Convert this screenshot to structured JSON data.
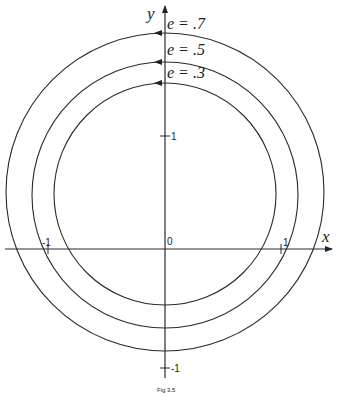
{
  "figure": {
    "x_axis_label": "x",
    "y_axis_label": "y",
    "origin_label": "0",
    "tick_labels": {
      "x_pos": "1",
      "x_neg": "-1",
      "y_pos": "1",
      "y_neg": "-1"
    },
    "curves": [
      {
        "label": "e = .7",
        "center_y": 0.5,
        "radius": 1.38
      },
      {
        "label": "e = .5",
        "center_y": 0.48,
        "radius": 1.16
      },
      {
        "label": "e = .3",
        "center_y": 0.49,
        "radius": 0.97
      }
    ],
    "caption": "Fig 3.5",
    "line_color": "#2a2a2a"
  }
}
